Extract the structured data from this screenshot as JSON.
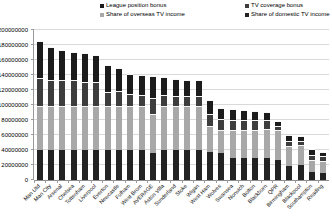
{
  "chart_data": {
    "type": "bar",
    "stacked": true,
    "title": "",
    "xlabel": "",
    "ylabel": "",
    "values_unit": "GBP",
    "ylim": [
      0,
      200000000
    ],
    "ytick_step": 20000000,
    "yticks": [
      "0",
      "20000000",
      "40000000",
      "60000000",
      "80000000",
      "100000000",
      "120000000",
      "140000000",
      "160000000",
      "180000000",
      "200000000"
    ],
    "grid": true,
    "legend_position": "top",
    "categories": [
      "Man Utd",
      "Man City",
      "Arsenal",
      "Chelsea",
      "Tottenham",
      "Liverpool",
      "Everton",
      "Newcastle",
      "Fulham",
      "West Brom",
      "AVERAGE",
      "Aston Villa",
      "Sunderland",
      "Stoke",
      "Wigan",
      "West Ham",
      "Wolves",
      "Swansea",
      "Norwich",
      "Bolton",
      "Blackburn",
      "QPR",
      "Birmingham",
      "Blackpool",
      "Southampton",
      "Reading"
    ],
    "stack_bottom_to_top": [
      3,
      2,
      1,
      0
    ],
    "series": [
      {
        "name": "League position bonus",
        "color": "#1c1c1c",
        "values": [
          48000000,
          43000000,
          39000000,
          36000000,
          37000000,
          35000000,
          35000000,
          30000000,
          25000000,
          25000000,
          28000000,
          22000000,
          21000000,
          21000000,
          20000000,
          17000000,
          13000000,
          13000000,
          12000000,
          11000000,
          10000000,
          5000000,
          6000000,
          5000000,
          7000000,
          5000000
        ]
      },
      {
        "name": "TV coverage bonus",
        "color": "#3d3d3d",
        "values": [
          37000000,
          34000000,
          34000000,
          34000000,
          31000000,
          31000000,
          18000000,
          19000000,
          15000000,
          14000000,
          20000000,
          14000000,
          13000000,
          12000000,
          12000000,
          15000000,
          13000000,
          12000000,
          11000000,
          11000000,
          10000000,
          5000000,
          6000000,
          5000000,
          5000000,
          5000000
        ]
      },
      {
        "name": "Share of overseas TV income",
        "color": "#a8a8a8",
        "values": [
          57000000,
          57000000,
          57000000,
          57000000,
          57000000,
          57000000,
          57000000,
          57000000,
          57000000,
          57000000,
          51000000,
          57000000,
          57000000,
          57000000,
          57000000,
          33000000,
          30000000,
          37000000,
          37000000,
          37000000,
          37000000,
          38000000,
          25000000,
          25000000,
          15000000,
          14000000
        ]
      },
      {
        "name": "Share of domestic TV income",
        "color": "#232323",
        "values": [
          40000000,
          40000000,
          40000000,
          40000000,
          40000000,
          40000000,
          40000000,
          40000000,
          40000000,
          40000000,
          36000000,
          40000000,
          40000000,
          40000000,
          40000000,
          38000000,
          36000000,
          29000000,
          29000000,
          29000000,
          30000000,
          27000000,
          19000000,
          20000000,
          11000000,
          10000000
        ]
      }
    ]
  }
}
